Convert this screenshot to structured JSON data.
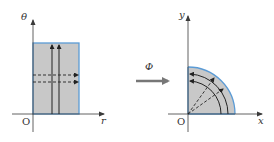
{
  "colors": {
    "region_fill": "#c8c8c8",
    "region_stroke": "#5b9bd5",
    "axis": "#3a3a3a",
    "curve": "#222222",
    "map_arrow": "#777777"
  },
  "left_plot": {
    "y_axis_label": "θ",
    "x_axis_label": "r",
    "origin_label": "O",
    "region": "rectangle",
    "solid_lines": 2,
    "dashed_lines": 2
  },
  "mapping": {
    "label": "Φ"
  },
  "right_plot": {
    "y_axis_label": "y",
    "x_axis_label": "x",
    "origin_label": "O",
    "region": "quarter-disk",
    "solid_arcs": 2,
    "dashed_rays": 2
  }
}
